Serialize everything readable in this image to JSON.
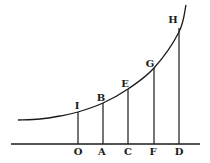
{
  "diagram": {
    "type": "exponential-curve-with-ordinates",
    "stroke_color": "#1a1a1a",
    "background": "#ffffff",
    "baseline": {
      "x1": 11,
      "x2": 200,
      "y": 144
    },
    "curve": {
      "points": [
        [
          18,
          120
        ],
        [
          40,
          119
        ],
        [
          60,
          116
        ],
        [
          78,
          112
        ],
        [
          103,
          103
        ],
        [
          128,
          89
        ],
        [
          154,
          68
        ],
        [
          179,
          32
        ],
        [
          186,
          5
        ]
      ]
    },
    "ordinates": [
      {
        "name": "IO",
        "x": 78,
        "top_y": 112,
        "top_label": "I",
        "base_label": "O"
      },
      {
        "name": "BA",
        "x": 103,
        "top_y": 103,
        "top_label": "B",
        "base_label": "A"
      },
      {
        "name": "EC",
        "x": 128,
        "top_y": 89,
        "top_label": "E",
        "base_label": "C"
      },
      {
        "name": "GF",
        "x": 154,
        "top_y": 68,
        "top_label": "G",
        "base_label": "F"
      },
      {
        "name": "HD",
        "x": 179,
        "top_y": 28,
        "top_label": "H",
        "base_label": "D"
      }
    ],
    "top_labels": [
      {
        "text": "I",
        "x": 77,
        "y": 109
      },
      {
        "text": "B",
        "x": 101,
        "y": 101
      },
      {
        "text": "E",
        "x": 125,
        "y": 87
      },
      {
        "text": "G",
        "x": 150,
        "y": 67
      },
      {
        "text": "H",
        "x": 173,
        "y": 23
      }
    ],
    "base_labels": [
      {
        "text": "O",
        "x": 78,
        "y": 155
      },
      {
        "text": "A",
        "x": 102,
        "y": 155
      },
      {
        "text": "C",
        "x": 128,
        "y": 155
      },
      {
        "text": "F",
        "x": 153,
        "y": 155
      },
      {
        "text": "D",
        "x": 179,
        "y": 155
      }
    ]
  }
}
